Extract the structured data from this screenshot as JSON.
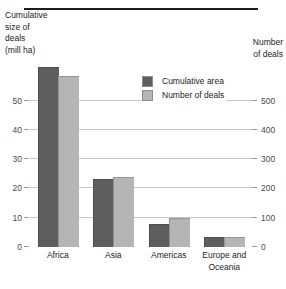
{
  "chart_data": {
    "type": "bar",
    "title": "",
    "categories": [
      "Africa",
      "Asia",
      "Americas",
      "Europe and Oceania"
    ],
    "series": [
      {
        "name": "Cumulative area",
        "axis": "left",
        "color": "#5e5e5e",
        "values": [
          61,
          23,
          7.5,
          3
        ]
      },
      {
        "name": "Number of deals",
        "axis": "right",
        "color": "#b5b5b5",
        "values": [
          580,
          236,
          96,
          30
        ]
      }
    ],
    "left_axis": {
      "label": "Cumulative\nsize of\ndeals\n(mill ha)",
      "ticks": [
        0,
        10,
        20,
        30,
        40,
        50
      ],
      "ticklabels": [
        "0",
        "10",
        "20",
        "30",
        "40",
        "50"
      ],
      "ylim": [
        0,
        81.6
      ]
    },
    "right_axis": {
      "label": "Number\nof deals",
      "ticks": [
        0,
        100,
        200,
        300,
        400,
        500
      ],
      "ticklabels": [
        "0",
        "100",
        "200",
        "300",
        "400",
        "500"
      ],
      "ylim": [
        0,
        816
      ]
    },
    "legend": {
      "position": "upper-center",
      "entries": [
        {
          "label": "Cumulative area",
          "color": "#5e5e5e",
          "swatch": "dark"
        },
        {
          "label": "Number of deals",
          "color": "#b5b5b5",
          "swatch": "light"
        }
      ]
    },
    "grid": "horizontal"
  },
  "colors": {
    "dark_bar": "#5e5e5e",
    "light_bar": "#b5b5b5",
    "gridline": "#c9c9c9",
    "axis": "#1d1d1d",
    "text": "#1d1d1d",
    "ticklabel": "#4a4a4a",
    "background": "#ffffff"
  }
}
